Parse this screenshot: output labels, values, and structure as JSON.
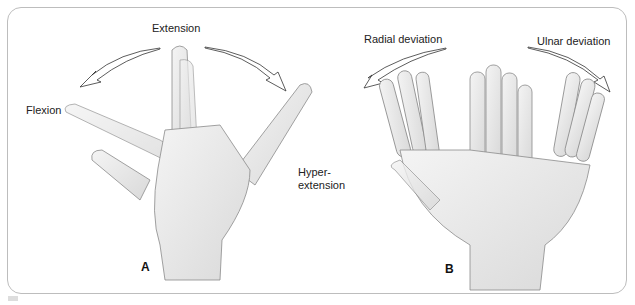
{
  "figure": {
    "panel_a": {
      "label": "A",
      "annotations": {
        "extension": "Extension",
        "flexion": "Flexion",
        "hyperextension_line1": "Hyper-",
        "hyperextension_line2": "extension"
      }
    },
    "panel_b": {
      "label": "B",
      "annotations": {
        "radial": "Radial deviation",
        "ulnar": "Ulnar deviation"
      }
    },
    "colors": {
      "frame": "#bdbdbd",
      "skin": "#ececec",
      "skin_outline": "#8a8a8a",
      "arrow": "#333333"
    }
  }
}
